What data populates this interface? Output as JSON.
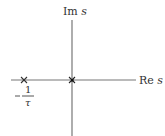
{
  "diagram": {
    "title": "",
    "axes": {
      "imag_label": "Im",
      "imag_var": "s",
      "real_label": "Re",
      "real_var": "s",
      "axis_color": "#777777"
    },
    "poles": [
      {
        "name": "pole-at-minus-one-over-tau",
        "marker": "×",
        "label_minus": "−",
        "label_numerator": "1",
        "label_denominator": "τ"
      },
      {
        "name": "pole-at-origin",
        "marker": "×"
      }
    ],
    "marker_color": "#333333"
  }
}
